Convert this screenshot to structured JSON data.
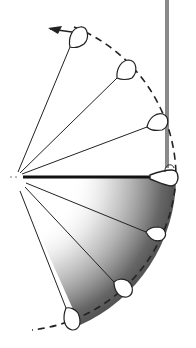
{
  "diagram": {
    "type": "motion-sweep-illustration",
    "pivot": {
      "x": 14,
      "y": 177
    },
    "arc_radius": 162,
    "colors": {
      "line": "#222222",
      "post": "#8a8a8a",
      "shade_dark": "#555555",
      "shade_light": "#bbbbbb",
      "background": "#ffffff"
    },
    "positions_above": [
      {
        "label": "upper-1",
        "angle_deg": -68
      },
      {
        "label": "upper-2",
        "angle_deg": -41
      },
      {
        "label": "upper-3",
        "angle_deg": -18
      }
    ],
    "position_horizontal": {
      "label": "horizontal",
      "angle_deg": 0
    },
    "positions_below": [
      {
        "label": "lower-1",
        "angle_deg": 20
      },
      {
        "label": "lower-2",
        "angle_deg": 42
      },
      {
        "label": "lower-3",
        "angle_deg": 66
      }
    ],
    "arrow_direction": "counter-clockwise upward"
  }
}
